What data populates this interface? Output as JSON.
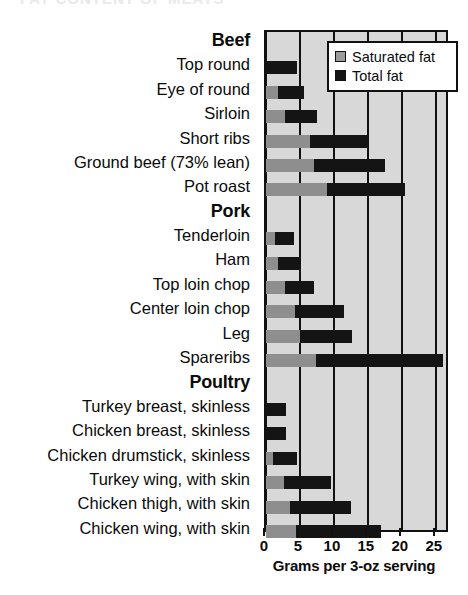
{
  "top_remnant": "FAT CONTENT OF MEATS",
  "legend": {
    "position": "top-right",
    "items": [
      {
        "label": "Saturated fat",
        "color": "#9a9a9a",
        "icon": "square-swatch-gray"
      },
      {
        "label": "Total fat",
        "color": "#141414",
        "icon": "square-swatch-black"
      }
    ]
  },
  "axis": {
    "title": "Grams per 3-oz serving",
    "ticks": [
      0,
      5,
      10,
      15,
      20,
      25
    ],
    "min": 0,
    "max": 26.5
  },
  "chart_data": {
    "type": "bar",
    "orientation": "horizontal",
    "stacked": true,
    "title": "",
    "subtitle": "",
    "xlabel": "Grams per 3-oz serving",
    "ylabel": "",
    "xlim": [
      0,
      26.5
    ],
    "grid": true,
    "legend_position": "top-right",
    "series": [
      {
        "name": "Saturated fat",
        "color": "#9a9a9a"
      },
      {
        "name": "Total fat",
        "color": "#141414"
      }
    ],
    "groups": [
      {
        "name": "Beef",
        "items": [
          {
            "label": "Top round",
            "saturated": 0.0,
            "total": 4.6
          },
          {
            "label": "Eye of round",
            "saturated": 1.8,
            "total": 5.6
          },
          {
            "label": "Sirloin",
            "saturated": 2.8,
            "total": 7.5
          },
          {
            "label": "Short ribs",
            "saturated": 6.5,
            "total": 15.0
          },
          {
            "label": "Ground beef (73% lean)",
            "saturated": 7.0,
            "total": 17.5
          },
          {
            "label": "Pot roast",
            "saturated": 9.0,
            "total": 20.5
          }
        ]
      },
      {
        "name": "Pork",
        "items": [
          {
            "label": "Tenderloin",
            "saturated": 1.3,
            "total": 4.1
          },
          {
            "label": "Ham",
            "saturated": 1.7,
            "total": 5.2
          },
          {
            "label": "Top loin chop",
            "saturated": 2.8,
            "total": 7.0
          },
          {
            "label": "Center loin chop",
            "saturated": 4.2,
            "total": 11.5
          },
          {
            "label": "Leg",
            "saturated": 5.0,
            "total": 12.7
          },
          {
            "label": "Spareribs",
            "saturated": 7.3,
            "total": 26.0
          }
        ]
      },
      {
        "name": "Poultry",
        "items": [
          {
            "label": "Turkey breast, skinless",
            "saturated": 0.0,
            "total": 3.0
          },
          {
            "label": "Chicken breast, skinless",
            "saturated": 0.0,
            "total": 3.0
          },
          {
            "label": "Chicken drumstick, skinless",
            "saturated": 1.0,
            "total": 4.5
          },
          {
            "label": "Turkey wing, with skin",
            "saturated": 2.6,
            "total": 9.5
          },
          {
            "label": "Chicken thigh, with skin",
            "saturated": 3.6,
            "total": 12.5
          },
          {
            "label": "Chicken wing, with skin",
            "saturated": 4.4,
            "total": 17.0
          }
        ]
      }
    ]
  }
}
